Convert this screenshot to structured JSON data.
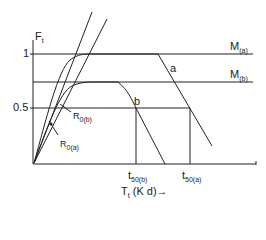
{
  "diagram": {
    "y_axis_label": "F",
    "y_axis_label_sub": "t",
    "x_axis_label": "T",
    "x_axis_label_sub": "t",
    "x_axis_unit": "(K d)",
    "x_axis_arrow": "→",
    "y_ticks": [
      {
        "label": "1",
        "value": 1
      },
      {
        "label": "0.5",
        "value": 0.5
      }
    ],
    "levels": {
      "m_a": {
        "label": "M",
        "sub": "(a)"
      },
      "m_b": {
        "label": "M",
        "sub": "(b)"
      }
    },
    "curves": {
      "a": {
        "label": "a"
      },
      "b": {
        "label": "b"
      }
    },
    "rates": {
      "r0b": {
        "label": "R",
        "sub": "0(b)"
      },
      "r0a": {
        "label": "R",
        "sub": "0(a)"
      }
    },
    "times": {
      "t50b": {
        "label": "t",
        "sub": "50(b)"
      },
      "t50a": {
        "label": "t",
        "sub": "50(a)"
      }
    },
    "line_color": "#222222"
  }
}
